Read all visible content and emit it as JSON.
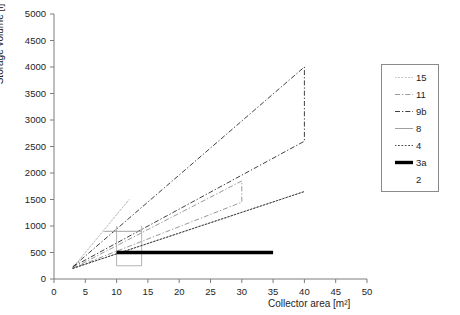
{
  "chart_data": {
    "type": "line",
    "title": "",
    "xlabel": "Collector area [m²]",
    "ylabel": "Storage volume [l]",
    "xlim": [
      0,
      50
    ],
    "ylim": [
      0,
      5000
    ],
    "xticks": [
      0,
      5,
      10,
      15,
      20,
      25,
      30,
      35,
      40,
      45,
      50
    ],
    "yticks": [
      0,
      500,
      1000,
      1500,
      2000,
      2500,
      3000,
      3500,
      4000,
      4500,
      5000
    ],
    "grid": false,
    "legend_position": "right",
    "series": [
      {
        "name": "15",
        "style": "dotted",
        "color": "#b9b9b9",
        "points": [
          [
            3,
            210
          ],
          [
            12,
            1500
          ],
          [
            3,
            210
          ]
        ]
      },
      {
        "name": "11",
        "style": "dash-dot",
        "color": "#8d8d8d",
        "points": [
          [
            3,
            200
          ],
          [
            30,
            1850
          ],
          [
            30,
            1450
          ],
          [
            3,
            200
          ]
        ]
      },
      {
        "name": "9b",
        "style": "dash-dot",
        "color": "#2b2b2b",
        "points": [
          [
            3,
            230
          ],
          [
            40,
            4000
          ],
          [
            40,
            2600
          ],
          [
            3,
            230
          ]
        ]
      },
      {
        "name": "8",
        "style": "solid-thin",
        "color": "#a0a0a0",
        "points": [
          [
            8,
            900
          ],
          [
            14,
            900
          ]
        ],
        "extra_segments": [
          [
            [
              10,
              250
            ],
            [
              14,
              250
            ]
          ],
          [
            [
              10,
              250
            ],
            [
              10,
              1000
            ]
          ],
          [
            [
              14,
              250
            ],
            [
              14,
              1000
            ]
          ]
        ]
      },
      {
        "name": "4",
        "style": "dotted",
        "color": "#3a3a3a",
        "points": [
          [
            3,
            200
          ],
          [
            40,
            1650
          ],
          [
            3,
            200
          ]
        ]
      },
      {
        "name": "3a",
        "style": "thick-solid",
        "color": "#000000",
        "points": [
          [
            10,
            500
          ],
          [
            35,
            500
          ]
        ]
      },
      {
        "name": "2",
        "style": "none",
        "color": "#000000",
        "points": []
      }
    ]
  },
  "legend": {
    "entries": [
      {
        "label": "15"
      },
      {
        "label": "11"
      },
      {
        "label": "9b"
      },
      {
        "label": "8"
      },
      {
        "label": "4"
      },
      {
        "label": "3a"
      },
      {
        "label": "2"
      }
    ]
  },
  "axes": {
    "y_tick_labels": [
      "5000",
      "4500",
      "4000",
      "3500",
      "3000",
      "2500",
      "2000",
      "1500",
      "1000",
      "500",
      "0"
    ],
    "x_tick_labels": [
      "0",
      "5",
      "10",
      "15",
      "20",
      "25",
      "30",
      "35",
      "40",
      "45",
      "50"
    ]
  }
}
